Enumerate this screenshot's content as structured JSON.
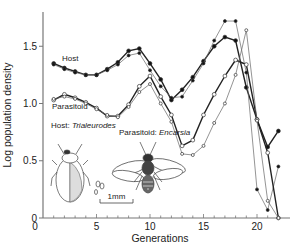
{
  "chart_data": {
    "type": "line",
    "title": "",
    "xlabel": "Generations",
    "ylabel": "Log population density",
    "xlim": [
      0,
      22.5
    ],
    "ylim": [
      0,
      1.75
    ],
    "xticks": [
      0,
      5,
      10,
      15,
      20
    ],
    "yticks": [
      0,
      0.5,
      1.0,
      1.5
    ],
    "xtick_labels": [
      "0",
      "5",
      "10",
      "15",
      "20"
    ],
    "ytick_labels": [
      "0",
      "0.5",
      "1.0",
      "1.5"
    ],
    "grid": false,
    "legend": "inline labels",
    "x": [
      1,
      2,
      3,
      4,
      5,
      6,
      7,
      8,
      9,
      10,
      11,
      12,
      13,
      14,
      15,
      16,
      17,
      18,
      19,
      20,
      21,
      22
    ],
    "series": [
      {
        "name": "Host (replicate A)",
        "marker": "filled",
        "weight": "bold",
        "values": [
          1.35,
          1.31,
          1.28,
          1.25,
          1.25,
          1.3,
          1.36,
          1.46,
          1.48,
          1.35,
          1.21,
          1.03,
          1.12,
          1.23,
          1.37,
          1.5,
          1.58,
          1.55,
          1.14,
          0.86,
          0.62,
          0.76
        ]
      },
      {
        "name": "Host (replicate B)",
        "marker": "filled",
        "weight": "thin",
        "values": [
          1.34,
          1.3,
          1.27,
          1.25,
          1.25,
          1.29,
          1.34,
          1.42,
          1.44,
          1.29,
          1.15,
          1.05,
          1.06,
          1.2,
          1.35,
          1.55,
          1.72,
          1.72,
          1.27,
          0.25,
          0.07,
          0.45
        ]
      },
      {
        "name": "Parasitoid (replicate A)",
        "marker": "open",
        "weight": "bold",
        "values": [
          1.03,
          1.08,
          1.05,
          1.01,
          0.96,
          0.89,
          0.89,
          0.99,
          1.15,
          1.24,
          1.06,
          0.9,
          0.63,
          0.68,
          0.9,
          1.08,
          1.24,
          1.38,
          1.34,
          0.86,
          0.57,
          0.0
        ]
      },
      {
        "name": "Parasitoid (replicate B)",
        "marker": "open",
        "weight": "thin",
        "values": [
          1.04,
          1.06,
          1.04,
          1.0,
          0.95,
          0.9,
          0.88,
          0.97,
          1.1,
          1.17,
          1.0,
          0.84,
          0.56,
          0.55,
          0.63,
          0.83,
          1.0,
          1.25,
          1.64,
          0.85,
          0.15,
          0.0
        ]
      }
    ],
    "annotations": [
      {
        "text": "Host",
        "x": 3.5,
        "y": 1.4
      },
      {
        "text": "Parasitoid",
        "x": 2.5,
        "y": 0.97
      },
      {
        "text": "Host: ",
        "italic_text": "Trialeurodes",
        "x": 1.2,
        "y": 0.75
      },
      {
        "text": "Parasitoid: ",
        "italic_text": "Encarsia",
        "x": 8.0,
        "y": 0.68
      },
      {
        "text": "1mm",
        "x": 7.3,
        "y": 0.12
      }
    ]
  },
  "labels": {
    "host": "Host",
    "parasitoid": "Parasitoid",
    "host_species_prefix": "Host: ",
    "host_species": "Trialeurodes",
    "parasitoid_species_prefix": "Parasitoid: ",
    "parasitoid_species": "Encarsia",
    "scale_bar": "1mm",
    "xlabel": "Generations",
    "ylabel": "Log population density"
  }
}
